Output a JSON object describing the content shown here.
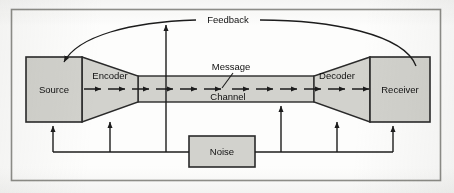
{
  "figure": {
    "border_color": "#8f8f8a",
    "background": "#fdfdfc"
  },
  "style": {
    "box_fill": "#d2d2cd",
    "box_stroke": "#2a2a2a",
    "channel_fill": "#d2d2cd",
    "line_color": "#1c1c1c",
    "text_color": "#111111"
  },
  "nodes": [
    {
      "id": "source",
      "label": "Source",
      "shape": "rect",
      "x": 26,
      "y": 57,
      "w": 56,
      "h": 65
    },
    {
      "id": "encoder",
      "label": "Encoder",
      "shape": "funnel",
      "x": 82,
      "y": 57,
      "w": 56,
      "h": 65
    },
    {
      "id": "channel",
      "label": "Channel",
      "shape": "band",
      "x": 138,
      "y": 76,
      "w": 176,
      "h": 26
    },
    {
      "id": "decoder",
      "label": "Decoder",
      "shape": "funnel-reversed",
      "x": 314,
      "y": 57,
      "w": 56,
      "h": 65
    },
    {
      "id": "receiver",
      "label": "Receiver",
      "shape": "rect",
      "x": 370,
      "y": 57,
      "w": 60,
      "h": 65
    },
    {
      "id": "noise",
      "label": "Noise",
      "shape": "rect",
      "x": 189,
      "y": 136,
      "w": 66,
      "h": 31
    }
  ],
  "annotations": [
    {
      "id": "feedback",
      "label": "Feedback",
      "x": 227,
      "y": 21
    },
    {
      "id": "message",
      "label": "Message",
      "x": 231,
      "y": 68
    }
  ],
  "flows": {
    "message_direction": "left-to-right",
    "feedback_direction": "receiver-to-source",
    "noise_targets": [
      "source",
      "encoder",
      "feedback-line",
      "channel",
      "decoder",
      "receiver"
    ]
  },
  "labels": {
    "source": "Source",
    "encoder": "Encoder",
    "channel": "Channel",
    "message": "Message",
    "decoder": "Decoder",
    "receiver": "Receiver",
    "noise": "Noise",
    "feedback": "Feedback"
  }
}
